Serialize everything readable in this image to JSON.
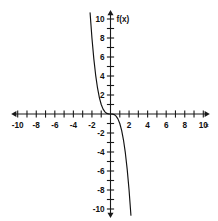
{
  "chart_data": {
    "type": "line",
    "title": "",
    "xlabel": "x",
    "ylabel": "f(x)",
    "xlim": [
      -10,
      10
    ],
    "ylim": [
      -10,
      10
    ],
    "grid": false,
    "legend": null,
    "x_tick_step": 1,
    "x_label_step": 2,
    "y_tick_step": 1,
    "y_label_step": 2,
    "x_tick_labels": [
      "-10",
      "-8",
      "-6",
      "-4",
      "-2",
      "2",
      "4",
      "6",
      "8",
      "10"
    ],
    "y_tick_labels": [
      "10",
      "8",
      "6",
      "4",
      "2",
      "-2",
      "-4",
      "-6",
      "-8",
      "-10"
    ],
    "series": [
      {
        "name": "f(x)",
        "equation": "f(x) = -x^3",
        "color": "#111111",
        "x": [
          -2.2,
          -2.0,
          -1.8,
          -1.6,
          -1.4,
          -1.2,
          -1.0,
          -0.8,
          -0.6,
          -0.4,
          -0.2,
          0.0,
          0.2,
          0.4,
          0.6,
          0.8,
          1.0,
          1.2,
          1.4,
          1.6,
          1.8,
          2.0,
          2.2
        ],
        "values": [
          10.65,
          8.0,
          5.83,
          4.1,
          2.74,
          1.73,
          1.0,
          0.51,
          0.22,
          0.06,
          0.01,
          0.0,
          -0.01,
          -0.06,
          -0.22,
          -0.51,
          -1.0,
          -1.73,
          -2.74,
          -4.1,
          -5.83,
          -8.0,
          -10.65
        ]
      }
    ]
  },
  "axes": {
    "x_axis_label": "x",
    "y_axis_label": "f(x)"
  }
}
